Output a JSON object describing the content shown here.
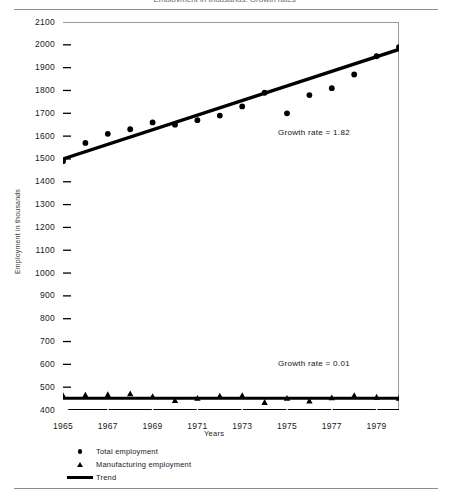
{
  "figure": {
    "cut_off_caption": "Employment in thousands, Growth rates",
    "has_top_rule": true,
    "has_bottom_rule": true
  },
  "annotations": [
    {
      "id": "growth-total",
      "text": "Growth rate = 1.82"
    },
    {
      "id": "growth-manufacturing",
      "text": "Growth rate = 0.01"
    }
  ],
  "legend": {
    "position": "below-axis-left",
    "items": [
      {
        "marker": "circle-marker-icon",
        "label": "Total employment"
      },
      {
        "marker": "triangle-marker-icon",
        "label": "Manufacturing employment"
      },
      {
        "marker": "line-marker-icon",
        "label": "Trend"
      }
    ]
  },
  "chart_data": {
    "type": "scatter",
    "title": "",
    "xlabel": "Years",
    "ylabel": "Employment in thousands",
    "xlim": [
      1965,
      1980
    ],
    "ylim": [
      400,
      2100
    ],
    "grid": false,
    "y_ticks": [
      400,
      500,
      600,
      700,
      800,
      900,
      1000,
      1100,
      1200,
      1300,
      1400,
      1500,
      1600,
      1700,
      1800,
      1900,
      2000,
      2100
    ],
    "y_tick_labels": [
      "400",
      "500",
      "600",
      "700",
      "800",
      "900",
      "1000",
      "1100",
      "1200",
      "1300",
      "1400",
      "1500",
      "1600",
      "1700",
      "1800",
      "1900",
      "2000",
      "2100"
    ],
    "x_ticks": [
      1965,
      1967,
      1969,
      1971,
      1973,
      1975,
      1977,
      1979
    ],
    "x_tick_labels": [
      "1965",
      "1967",
      "1969",
      "1971",
      "1973",
      "1975",
      "1977",
      "1979"
    ],
    "series": [
      {
        "name": "Total employment",
        "marker": "circle",
        "x": [
          1965,
          1966,
          1967,
          1968,
          1969,
          1970,
          1971,
          1972,
          1973,
          1974,
          1975,
          1976,
          1977,
          1978,
          1979,
          1980
        ],
        "values": [
          1490,
          1570,
          1610,
          1630,
          1660,
          1650,
          1670,
          1690,
          1730,
          1790,
          1700,
          1780,
          1810,
          1870,
          1950,
          1990
        ]
      },
      {
        "name": "Manufacturing employment",
        "marker": "triangle",
        "x": [
          1965,
          1966,
          1967,
          1968,
          1969,
          1970,
          1971,
          1972,
          1973,
          1974,
          1975,
          1976,
          1977,
          1978,
          1979,
          1980
        ],
        "values": [
          462,
          464,
          466,
          470,
          458,
          440,
          450,
          460,
          462,
          432,
          450,
          438,
          452,
          462,
          455,
          450
        ]
      },
      {
        "name": "Trend (total)",
        "marker": "line",
        "x": [
          1965,
          1980
        ],
        "values": [
          1500,
          1980
        ]
      },
      {
        "name": "Trend (manufacturing)",
        "marker": "line",
        "x": [
          1965,
          1980
        ],
        "values": [
          452,
          452
        ]
      }
    ]
  }
}
